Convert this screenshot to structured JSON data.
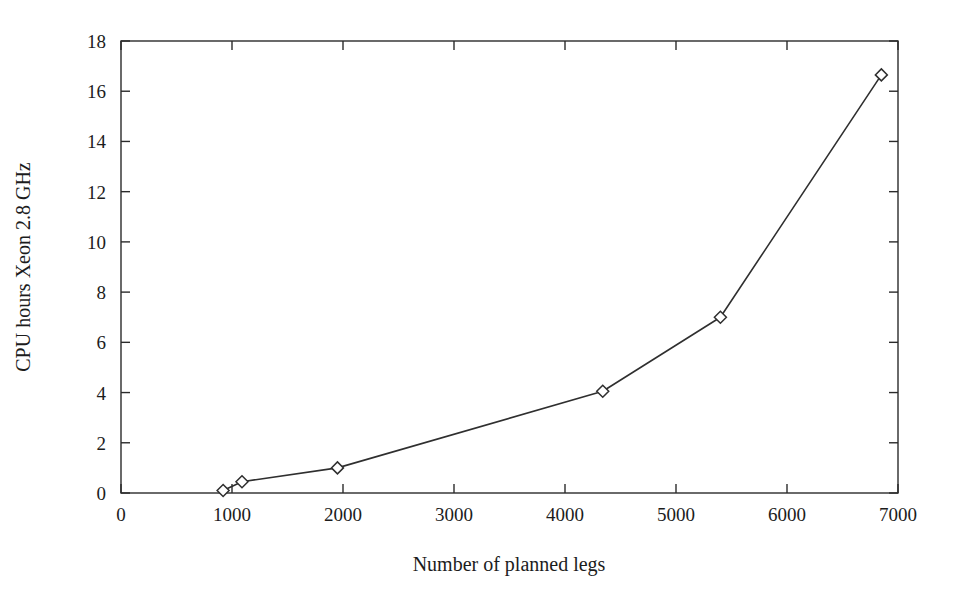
{
  "figure": {
    "background_color": "#ffffff",
    "line_color": "#2f2f2f",
    "frame_color": "#2b2b2b",
    "text_color": "#1c1c1c"
  },
  "chart_data": {
    "type": "line",
    "title": "",
    "xlabel": "Number of planned legs",
    "ylabel": "CPU hours Xeon 2.8 GHz",
    "xlim": [
      0,
      7000
    ],
    "ylim": [
      0,
      18
    ],
    "xticks": [
      0,
      1000,
      2000,
      3000,
      4000,
      5000,
      6000,
      7000
    ],
    "xtick_labels": [
      "0",
      "1000",
      "2000",
      "3000",
      "4000",
      "5000",
      "6000",
      "7000"
    ],
    "yticks": [
      0,
      2,
      4,
      6,
      8,
      10,
      12,
      14,
      16,
      18
    ],
    "ytick_labels": [
      "0",
      "2",
      "4",
      "6",
      "8",
      "10",
      "12",
      "14",
      "16",
      "18"
    ],
    "grid": false,
    "legend": false,
    "legend_position": "none",
    "marker": "diamond",
    "series": [
      {
        "name": "CPU hours",
        "x": [
          920,
          1090,
          1950,
          4340,
          5400,
          6850
        ],
        "y": [
          0.1,
          0.45,
          1.0,
          4.05,
          7.0,
          16.65
        ],
        "points": [
          {
            "x": 920,
            "y": 0.1
          },
          {
            "x": 1090,
            "y": 0.45
          },
          {
            "x": 1950,
            "y": 1.0
          },
          {
            "x": 4340,
            "y": 4.05
          },
          {
            "x": 5400,
            "y": 7.0
          },
          {
            "x": 6850,
            "y": 16.65
          }
        ]
      }
    ]
  }
}
